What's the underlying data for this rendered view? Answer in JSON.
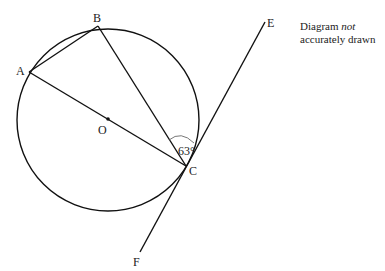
{
  "diagram": {
    "points": {
      "A": {
        "label": "A",
        "x": 29,
        "y": 72
      },
      "B": {
        "label": "B",
        "x": 98,
        "y": 26
      },
      "C": {
        "label": "C",
        "x": 186,
        "y": 166
      },
      "O": {
        "label": "O",
        "x": 108,
        "y": 119
      },
      "E": {
        "label": "E",
        "x": 265,
        "y": 22
      },
      "F": {
        "label": "F",
        "x": 140,
        "y": 252
      }
    },
    "circle": {
      "cx": 108,
      "cy": 120,
      "r": 91
    },
    "angle_label": "63°",
    "note": {
      "line1_prefix": "Diagram ",
      "line1_emph": "not",
      "line2": "accurately drawn"
    }
  }
}
